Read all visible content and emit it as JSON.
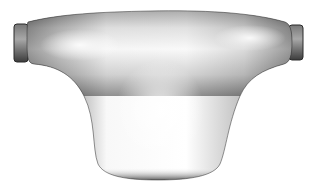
{
  "image": {
    "subject": "3D rendered T-shaped handle",
    "width": 309,
    "height": 195,
    "colors": {
      "background": "#ffffff",
      "highlight": "#ffffff",
      "midtone": "#b8b8b8",
      "shadow": "#3a3a3a",
      "edge": "#1e1e1e"
    }
  }
}
